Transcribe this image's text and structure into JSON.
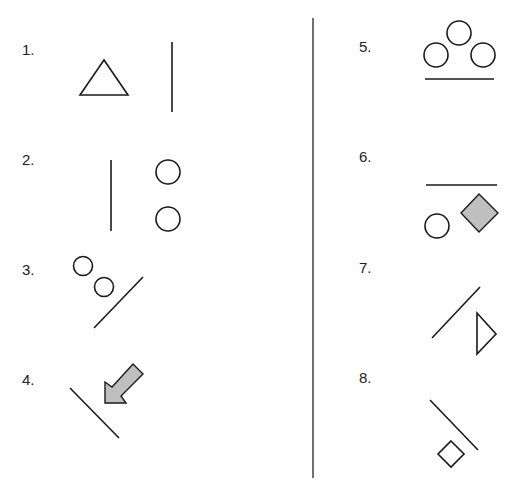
{
  "figure": {
    "type": "spatial-relations-puzzle",
    "colors": {
      "stroke": "#1a1a1a",
      "fill_gray": "#bfbfbf",
      "background": "#ffffff"
    },
    "items": [
      {
        "label": "1.",
        "shapes": [
          "triangle",
          "vertical-line"
        ]
      },
      {
        "label": "2.",
        "shapes": [
          "vertical-line",
          "circle",
          "circle"
        ]
      },
      {
        "label": "3.",
        "shapes": [
          "circle",
          "circle",
          "diagonal-line"
        ]
      },
      {
        "label": "4.",
        "shapes": [
          "diagonal-line",
          "gray-arrow-down-left"
        ]
      },
      {
        "label": "5.",
        "shapes": [
          "circle",
          "circle",
          "circle",
          "horizontal-line"
        ]
      },
      {
        "label": "6.",
        "shapes": [
          "horizontal-line",
          "circle",
          "gray-diamond"
        ]
      },
      {
        "label": "7.",
        "shapes": [
          "diagonal-line",
          "triangle-pointing-right"
        ]
      },
      {
        "label": "8.",
        "shapes": [
          "diagonal-line",
          "diamond"
        ]
      }
    ]
  }
}
